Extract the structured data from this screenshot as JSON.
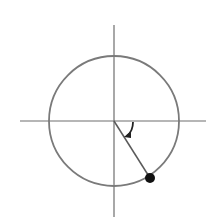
{
  "diagram": {
    "type": "unit-circle-angle",
    "canvas": {
      "width": 216,
      "height": 223
    },
    "colors": {
      "background": "#ffffff",
      "axis": "#6e6e6e",
      "circle": "#7a7a7a",
      "radius_line": "#5a5a5a",
      "point": "#111111",
      "arc": "#222222"
    },
    "center": {
      "x": 114,
      "y": 121
    },
    "circle": {
      "r": 65
    },
    "x_axis": {
      "x1": 20,
      "x2": 206,
      "y": 121
    },
    "y_axis": {
      "x": 114,
      "y1": 25,
      "y2": 217
    },
    "radius_line": {
      "x1": 114,
      "y1": 121,
      "x2": 150,
      "y2": 178
    },
    "point": {
      "x": 150,
      "y": 178,
      "r": 5
    },
    "angle_arc": {
      "path": "M 133 122 Q 133 131 127 136",
      "arrow": "M 124 137 L 131 131 L 131 138 Z",
      "direction": "clockwise"
    }
  }
}
